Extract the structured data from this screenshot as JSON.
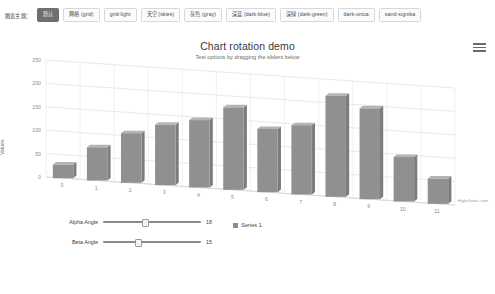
{
  "toolbar": {
    "label": "图表主题：",
    "themes": [
      {
        "label": "默认",
        "active": true
      },
      {
        "label": "网格 (grid)",
        "active": false
      },
      {
        "label": "grid-light",
        "active": false
      },
      {
        "label": "天空 (skies)",
        "active": false
      },
      {
        "label": "灰色 (gray)",
        "active": false
      },
      {
        "label": "深蓝 (dark-blue)",
        "active": false
      },
      {
        "label": "深绿 (dark-green)",
        "active": false
      },
      {
        "label": "dark-unica",
        "active": false
      },
      {
        "label": "sand-signika",
        "active": false
      }
    ]
  },
  "chart": {
    "title": "Chart rotation demo",
    "subtitle": "Test options by dragging the sliders below",
    "credits": "Highcharts.com",
    "menu_icon": "hamburger-menu-icon"
  },
  "legend": {
    "items": [
      {
        "name": "Series 1",
        "color": "#8d8d8d"
      }
    ]
  },
  "controls": {
    "alpha": {
      "label": "Alpha Angle",
      "value": "18",
      "min": 0,
      "max": 45,
      "knob_pct": 40
    },
    "beta": {
      "label": "Beta Angle",
      "value": "15",
      "min": 0,
      "max": 45,
      "knob_pct": 33
    }
  },
  "chart_data": {
    "type": "bar",
    "title": "Chart rotation demo",
    "subtitle": "Test options by dragging the sliders below",
    "categories": [
      "0",
      "1",
      "2",
      "3",
      "4",
      "5",
      "6",
      "7",
      "8",
      "9",
      "10",
      "11"
    ],
    "series": [
      {
        "name": "Series 1",
        "color": "#909090",
        "values": [
          29,
          71,
          106,
          129,
          144,
          176,
          135,
          148,
          216,
          194,
          95,
          54
        ]
      }
    ],
    "xlabel": "",
    "ylabel": "Values",
    "ylim": [
      0,
      250
    ],
    "yticks": [
      0,
      50,
      100,
      150,
      200,
      250
    ],
    "grid": true,
    "legend_position": "bottom",
    "view": "3d",
    "alpha": 18,
    "beta": 15
  }
}
